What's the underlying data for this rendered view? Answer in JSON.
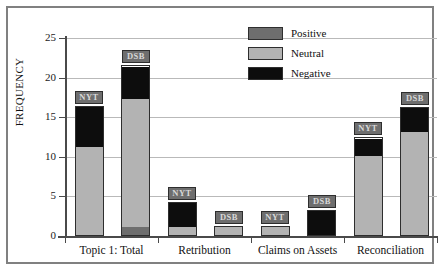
{
  "chart_data": {
    "type": "bar",
    "stacked": true,
    "title": "",
    "xlabel": "",
    "ylabel": "FREQUENCY",
    "ylim": [
      0,
      25
    ],
    "y_ticks": [
      0,
      5,
      10,
      15,
      20,
      25
    ],
    "grid": true,
    "legend_position": "top-right",
    "categories": [
      "Topic 1: Total",
      "Retribution",
      "Claims on Assets",
      "Reconciliation"
    ],
    "sources": [
      "NYT",
      "DSB"
    ],
    "series": [
      {
        "name": "Positive",
        "color": "#6e6e6e"
      },
      {
        "name": "Neutral",
        "color": "#b3b3b3"
      },
      {
        "name": "Negative",
        "color": "#0d0d0d"
      }
    ],
    "bars": [
      {
        "category": "Topic 1: Total",
        "source": "NYT",
        "total": 16.2,
        "segments": [
          {
            "series": "Neutral",
            "value": 11.1
          },
          {
            "series": "Negative",
            "value": 5.1
          }
        ]
      },
      {
        "category": "Topic 1: Total",
        "source": "DSB",
        "total": 21.3,
        "segments": [
          {
            "series": "Positive",
            "value": 1.0
          },
          {
            "series": "Neutral",
            "value": 16.2
          },
          {
            "series": "Negative",
            "value": 4.1
          }
        ]
      },
      {
        "category": "Retribution",
        "source": "NYT",
        "total": 4.0,
        "segments": [
          {
            "series": "Neutral",
            "value": 1.0
          },
          {
            "series": "Negative",
            "value": 3.0
          }
        ]
      },
      {
        "category": "Retribution",
        "source": "DSB",
        "total": 1.0,
        "segments": [
          {
            "series": "Neutral",
            "value": 1.0
          }
        ]
      },
      {
        "category": "Claims on Assets",
        "source": "NYT",
        "total": 1.0,
        "segments": [
          {
            "series": "Neutral",
            "value": 1.0
          }
        ]
      },
      {
        "category": "Claims on Assets",
        "source": "DSB",
        "total": 3.0,
        "segments": [
          {
            "series": "Negative",
            "value": 3.0
          }
        ]
      },
      {
        "category": "Reconciliation",
        "source": "NYT",
        "total": 12.2,
        "segments": [
          {
            "series": "Neutral",
            "value": 10.0
          },
          {
            "series": "Negative",
            "value": 2.2
          }
        ]
      },
      {
        "category": "Reconciliation",
        "source": "DSB",
        "total": 16.0,
        "segments": [
          {
            "series": "Neutral",
            "value": 13.0
          },
          {
            "series": "Negative",
            "value": 3.0
          }
        ]
      }
    ]
  },
  "axis": {
    "y_title": "FREQUENCY",
    "y_tick_labels": [
      "25",
      "20",
      "15",
      "10",
      "5",
      "0"
    ]
  },
  "legend": {
    "entries": [
      {
        "label": "Positive"
      },
      {
        "label": "Neutral"
      },
      {
        "label": "Negative"
      }
    ]
  },
  "categories": [
    {
      "label": "Topic 1: Total"
    },
    {
      "label": "Retribution"
    },
    {
      "label": "Claims on Assets"
    },
    {
      "label": "Reconciliation"
    }
  ],
  "bar_tags": [
    {
      "label": "NYT"
    },
    {
      "label": "DSB"
    },
    {
      "label": "NYT"
    },
    {
      "label": "DSB"
    },
    {
      "label": "NYT"
    },
    {
      "label": "DSB"
    },
    {
      "label": "NYT"
    },
    {
      "label": "DSB"
    }
  ]
}
